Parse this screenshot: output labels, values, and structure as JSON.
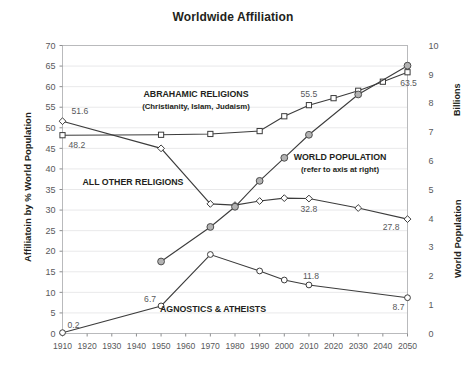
{
  "chart_data": {
    "type": "line",
    "title": "Worldwide Affiliation",
    "xlabel": "",
    "ylabel": "Affiliatoin by % World Population",
    "y2label": "World Population",
    "y2label_units": "Billions",
    "x": [
      1910,
      1920,
      1930,
      1940,
      1950,
      1960,
      1970,
      1980,
      1990,
      2000,
      2010,
      2020,
      2030,
      2040,
      2050
    ],
    "xlim": [
      1910,
      2050
    ],
    "ylim": [
      0,
      70
    ],
    "y2lim": [
      0,
      10
    ],
    "yticks": [
      0,
      5,
      10,
      15,
      20,
      25,
      30,
      35,
      40,
      45,
      50,
      55,
      60,
      65,
      70
    ],
    "y2ticks": [
      0,
      1,
      2,
      3,
      4,
      5,
      6,
      7,
      8,
      9,
      10
    ],
    "xticks": [
      "1910",
      "1920",
      "1930",
      "1940",
      "1950",
      "1960",
      "1970",
      "1980",
      "1990",
      "2000",
      "2010",
      "2020",
      "2030",
      "2040",
      "2050"
    ],
    "grid": true,
    "legend": "in-plot annotations",
    "series": [
      {
        "name": "ABRAHAMIC RELIGIONS",
        "sublabel": "(Christianity, Islam, Judaism)",
        "marker": "open-square",
        "axis": "left",
        "x": [
          1910,
          1950,
          1970,
          1990,
          2000,
          2010,
          2020,
          2030,
          2040,
          2050
        ],
        "values": [
          48.2,
          48.3,
          48.5,
          49.2,
          52.8,
          55.5,
          57.2,
          59.0,
          61.2,
          63.5
        ]
      },
      {
        "name": "ALL OTHER RELIGIONS",
        "sublabel": "",
        "marker": "open-diamond",
        "axis": "left",
        "x": [
          1910,
          1950,
          1970,
          1980,
          1990,
          2000,
          2010,
          2030,
          2050
        ],
        "values": [
          51.6,
          45.0,
          31.5,
          31.2,
          32.2,
          32.9,
          32.8,
          30.5,
          27.8
        ]
      },
      {
        "name": "AGNOSTICS & ATHEISTS",
        "sublabel": "",
        "marker": "open-circle",
        "axis": "left",
        "x": [
          1910,
          1950,
          1970,
          1990,
          2000,
          2010,
          2050
        ],
        "values": [
          0.2,
          6.7,
          19.2,
          15.2,
          13.0,
          11.8,
          8.7
        ]
      },
      {
        "name": "WORLD POPULATION",
        "sublabel": "(refer to axis at right)",
        "marker": "filled-circle",
        "axis": "right",
        "x": [
          1950,
          1970,
          1980,
          1990,
          2000,
          2010,
          2030,
          2050
        ],
        "values": [
          2.5,
          3.7,
          4.4,
          5.3,
          6.1,
          6.9,
          8.3,
          9.3
        ]
      }
    ],
    "point_labels": [
      {
        "text": "51.6",
        "x": 1910,
        "y": 51.6,
        "series": "ALL OTHER RELIGIONS"
      },
      {
        "text": "48.2",
        "x": 1910,
        "y": 48.2,
        "series": "ABRAHAMIC RELIGIONS"
      },
      {
        "text": "0.2",
        "x": 1910,
        "y": 0.2,
        "series": "AGNOSTICS & ATHEISTS"
      },
      {
        "text": "6.7",
        "x": 1950,
        "y": 6.7,
        "series": "AGNOSTICS & ATHEISTS"
      },
      {
        "text": "55.5",
        "x": 2010,
        "y": 55.5,
        "series": "ABRAHAMIC RELIGIONS"
      },
      {
        "text": "32.8",
        "x": 2010,
        "y": 32.8,
        "series": "ALL OTHER RELIGIONS"
      },
      {
        "text": "11.8",
        "x": 2010,
        "y": 11.8,
        "series": "AGNOSTICS & ATHEISTS"
      },
      {
        "text": "63.5",
        "x": 2050,
        "y": 63.5,
        "series": "ABRAHAMIC RELIGIONS"
      },
      {
        "text": "27.8",
        "x": 2050,
        "y": 27.8,
        "series": "ALL OTHER RELIGIONS"
      },
      {
        "text": "8.7",
        "x": 2050,
        "y": 8.7,
        "series": "AGNOSTICS & ATHEISTS"
      }
    ],
    "colors": {
      "line": "#3c3c3c",
      "marker_fill_open": "#ffffff",
      "marker_fill_population": "#b3b3b3",
      "grid": "#e9e9ea",
      "frame": "#b9babc",
      "text": "#231f20",
      "tick_text": "#58595b"
    }
  },
  "labels": {
    "title": "Worldwide Affiliation",
    "y_left_title": "Affiliatoin by % World Population",
    "y_right_billions": "Billions",
    "y_right_title": "World Population",
    "abrahamic_main": "ABRAHAMIC RELIGIONS",
    "abrahamic_sub": "(Christianity, Islam, Judaism)",
    "all_other": "ALL OTHER RELIGIONS",
    "agnostics": "AGNOSTICS & ATHEISTS",
    "world_pop_main": "WORLD POPULATION",
    "world_pop_sub": "(refer to axis at right)",
    "v_51_6": "51.6",
    "v_48_2": "48.2",
    "v_0_2": "0.2",
    "v_6_7": "6.7",
    "v_55_5": "55.5",
    "v_32_8": "32.8",
    "v_11_8": "11.8",
    "v_63_5": "63.5",
    "v_27_8": "27.8",
    "v_8_7": "8.7"
  }
}
